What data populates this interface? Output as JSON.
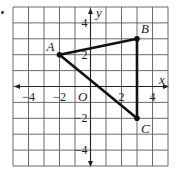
{
  "diagram": {
    "x_axis_label": "x",
    "y_axis_label": "y",
    "origin_label": "O",
    "x_range": [
      -5,
      5
    ],
    "y_range": [
      -5,
      5
    ],
    "x_tick_labels": [
      {
        "value": -4,
        "text": "−4"
      },
      {
        "value": -2,
        "text": "−2"
      },
      {
        "value": 2,
        "text": "2"
      },
      {
        "value": 4,
        "text": "4"
      }
    ],
    "y_tick_labels": [
      {
        "value": 4,
        "text": "4"
      },
      {
        "value": 2,
        "text": "2"
      },
      {
        "value": -2,
        "text": "−2"
      },
      {
        "value": -4,
        "text": "−4"
      }
    ],
    "points": [
      {
        "name": "A",
        "x": -2,
        "y": 2
      },
      {
        "name": "B",
        "x": 3,
        "y": 3
      },
      {
        "name": "C",
        "x": 3,
        "y": -2
      }
    ],
    "segments": [
      [
        "A",
        "B"
      ],
      [
        "B",
        "C"
      ],
      [
        "A",
        "C"
      ]
    ],
    "colors": {
      "ink": "#111111",
      "grid": "#5a5a5a"
    }
  }
}
